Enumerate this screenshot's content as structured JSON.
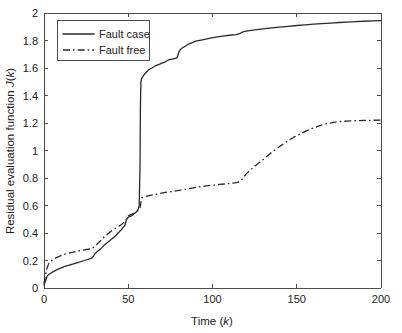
{
  "chart_data": {
    "type": "line",
    "title": "",
    "xlabel": "Time (k)",
    "xlabel_plain": "Time",
    "xlabel_italic_var": "k",
    "ylabel": "Residual evaluation function J(k)",
    "ylabel_plain_1": "Residual evaluation function ",
    "ylabel_italic_var_1": "J",
    "ylabel_plain_2": "(",
    "ylabel_italic_var_2": "k",
    "ylabel_plain_3": ")",
    "xlim": [
      0,
      200
    ],
    "ylim": [
      0,
      2
    ],
    "xticks": [
      0,
      50,
      100,
      150,
      200
    ],
    "xtick_labels": [
      "0",
      "50",
      "100",
      "150",
      "200"
    ],
    "yticks": [
      0,
      0.2,
      0.4,
      0.6,
      0.8,
      1,
      1.2,
      1.4,
      1.6,
      1.8,
      2
    ],
    "ytick_labels": [
      "0",
      "0.2",
      "0.4",
      "0.6",
      "0.8",
      "1",
      "1.2",
      "1.4",
      "1.6",
      "1.8",
      "2"
    ],
    "grid": false,
    "legend_position": "upper-left",
    "line_color": "#2b2b2b",
    "series": [
      {
        "name": "Fault case",
        "style": "solid",
        "x": [
          0,
          1,
          2,
          3,
          5,
          8,
          12,
          16,
          20,
          24,
          28,
          29,
          30,
          32,
          34,
          36,
          38,
          40,
          42,
          44,
          46,
          48,
          49,
          50,
          51,
          52,
          53,
          54,
          55,
          56,
          56.5,
          57,
          57.2,
          57.5,
          58,
          59,
          60,
          62,
          64,
          66,
          68,
          70,
          72,
          74,
          76,
          78,
          79,
          80,
          81,
          82,
          84,
          86,
          88,
          90,
          94,
          98,
          102,
          106,
          110,
          114,
          116,
          118,
          120,
          125,
          130,
          135,
          140,
          145,
          150,
          155,
          160,
          165,
          170,
          175,
          180,
          185,
          190,
          195,
          200
        ],
        "y": [
          0.02,
          0.055,
          0.09,
          0.1,
          0.115,
          0.135,
          0.155,
          0.17,
          0.185,
          0.2,
          0.215,
          0.225,
          0.245,
          0.27,
          0.29,
          0.315,
          0.335,
          0.355,
          0.375,
          0.4,
          0.425,
          0.455,
          0.5,
          0.515,
          0.52,
          0.525,
          0.535,
          0.545,
          0.555,
          0.575,
          0.6,
          0.9,
          1.3,
          1.5,
          1.525,
          1.545,
          1.56,
          1.585,
          1.6,
          1.615,
          1.625,
          1.635,
          1.645,
          1.66,
          1.665,
          1.67,
          1.675,
          1.715,
          1.735,
          1.745,
          1.76,
          1.775,
          1.785,
          1.795,
          1.805,
          1.815,
          1.825,
          1.832,
          1.838,
          1.843,
          1.85,
          1.862,
          1.868,
          1.878,
          1.885,
          1.892,
          1.898,
          1.903,
          1.909,
          1.914,
          1.919,
          1.923,
          1.927,
          1.931,
          1.934,
          1.937,
          1.94,
          1.943,
          1.945
        ]
      },
      {
        "name": "Fault free",
        "style": "dashdot",
        "x": [
          0,
          1,
          2,
          3,
          5,
          8,
          12,
          16,
          20,
          24,
          28,
          30,
          32,
          34,
          36,
          38,
          40,
          42,
          44,
          46,
          48,
          49,
          50,
          52,
          54,
          55,
          56,
          57,
          57.5,
          58,
          60,
          64,
          68,
          72,
          76,
          80,
          84,
          88,
          92,
          96,
          100,
          104,
          108,
          112,
          115,
          117,
          118,
          120,
          124,
          128,
          132,
          136,
          140,
          144,
          148,
          152,
          156,
          160,
          164,
          168,
          172,
          176,
          180,
          185,
          190,
          195,
          200
        ],
        "y": [
          0.03,
          0.1,
          0.155,
          0.18,
          0.205,
          0.225,
          0.245,
          0.258,
          0.268,
          0.278,
          0.285,
          0.3,
          0.325,
          0.35,
          0.375,
          0.395,
          0.415,
          0.43,
          0.445,
          0.462,
          0.482,
          0.5,
          0.525,
          0.535,
          0.548,
          0.555,
          0.565,
          0.585,
          0.62,
          0.655,
          0.665,
          0.675,
          0.685,
          0.695,
          0.702,
          0.71,
          0.718,
          0.727,
          0.735,
          0.742,
          0.748,
          0.753,
          0.757,
          0.762,
          0.768,
          0.78,
          0.8,
          0.83,
          0.875,
          0.915,
          0.955,
          0.995,
          1.03,
          1.065,
          1.095,
          1.12,
          1.145,
          1.165,
          1.182,
          1.196,
          1.205,
          1.211,
          1.214,
          1.217,
          1.219,
          1.22,
          1.221
        ]
      }
    ],
    "annotations": []
  },
  "legend": {
    "entries": [
      {
        "label": "Fault case",
        "style": "solid"
      },
      {
        "label": "Fault free",
        "style": "dashdot"
      }
    ]
  }
}
